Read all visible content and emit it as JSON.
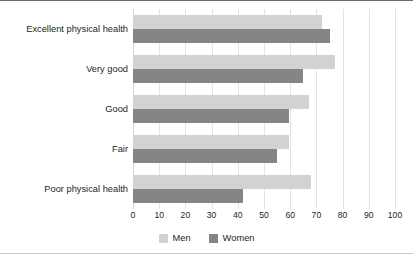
{
  "chart_data": {
    "type": "bar",
    "orientation": "horizontal",
    "title": "",
    "subtitle": "",
    "xlabel": "",
    "ylabel": "",
    "xlim": [
      0,
      100
    ],
    "xticks": [
      0,
      10,
      20,
      30,
      40,
      50,
      60,
      70,
      80,
      90,
      100
    ],
    "xtick_labels": [
      "0",
      "10",
      "20",
      "30",
      "40",
      "50",
      "60",
      "70",
      "80",
      "90",
      "100"
    ],
    "grid": true,
    "legend_position": "bottom-center",
    "categories": [
      "Excellent physical health",
      "Very good",
      "Good",
      "Fair",
      "Poor physical health"
    ],
    "series": [
      {
        "name": "Men",
        "color": "#d2d2d2",
        "values": [
          72,
          77,
          67,
          59.5,
          68
        ]
      },
      {
        "name": "Women",
        "color": "#858585",
        "values": [
          75,
          65,
          59.5,
          55,
          42
        ]
      }
    ]
  },
  "legend": {
    "items": [
      {
        "label": "Men",
        "swatch_class": "men"
      },
      {
        "label": "Women",
        "swatch_class": "women"
      }
    ]
  },
  "colors": {
    "men": "#d2d2d2",
    "women": "#858585",
    "gridline": "#e3e3e3",
    "text": "#231f20",
    "frame_top": "#6e6e6e",
    "frame_bottom": "#c8c8c8",
    "background": "#ffffff"
  }
}
